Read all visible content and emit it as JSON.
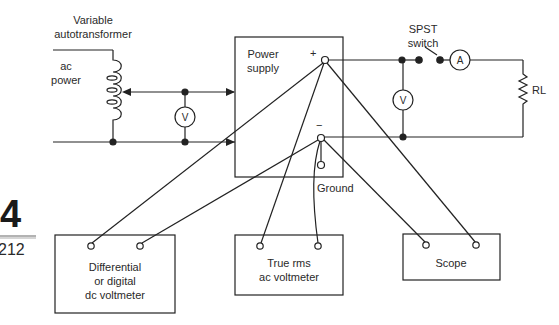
{
  "diagram": {
    "type": "circuit-schematic",
    "stroke_color": "#222222",
    "background": "#ffffff"
  },
  "margin": {
    "chapter_number": "4",
    "page_number": "212"
  },
  "labels": {
    "autotransformer": [
      "Variable",
      "autotransformer"
    ],
    "ac_power": [
      "ac",
      "power"
    ],
    "power_supply": [
      "Power",
      "supply"
    ],
    "plus_terminal": "+",
    "minus_terminal": "−",
    "ground": "Ground",
    "switch": [
      "SPST",
      "switch"
    ],
    "load": "RL",
    "voltmeter_symbol": "V",
    "ammeter_symbol": "A"
  },
  "instruments": [
    {
      "id": "dc-voltmeter",
      "lines": [
        "Differential",
        "or digital",
        "dc voltmeter"
      ]
    },
    {
      "id": "ac-voltmeter",
      "lines": [
        "True rms",
        "ac voltmeter"
      ]
    },
    {
      "id": "scope",
      "lines": [
        "Scope"
      ]
    }
  ]
}
